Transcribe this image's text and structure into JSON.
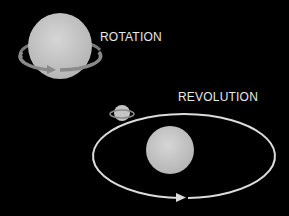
{
  "labels": {
    "rotation": "ROTATION",
    "revolution": "REVOLUTION"
  },
  "colors": {
    "background": "#000000",
    "sphere": "#c9c9c9",
    "orbit": "#dcdcdc",
    "ring": "#8a8a8a",
    "text": "#e8e8e8"
  }
}
